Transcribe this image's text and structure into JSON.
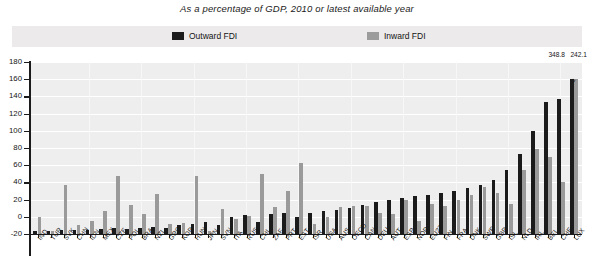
{
  "title": "As a percentage of GDP, 2010 or latest available year",
  "legend": {
    "outward": {
      "label": "Outward FDI",
      "color": "#1b1b1b"
    },
    "inward": {
      "label": "Inward FDI",
      "color": "#9a9a9a"
    }
  },
  "annotations": {
    "lux_outward_value": "348.8",
    "lux_inward_value": "242.1",
    "break_symbol": "≈"
  },
  "chart_data": {
    "type": "bar",
    "title": "As a percentage of GDP, 2010 or latest available year",
    "xlabel": "",
    "ylabel": "",
    "ylim": [
      -20,
      180
    ],
    "yticks": [
      -20,
      0,
      20,
      40,
      60,
      80,
      100,
      120,
      140,
      160,
      180
    ],
    "grid": true,
    "legend_position": "top",
    "categories": [
      "IND",
      "TUR",
      "SVK",
      "CHN",
      "IDN",
      "MEX",
      "CZE",
      "POL",
      "BRA",
      "NZL",
      "GRC",
      "KOR",
      "HUN",
      "JPN",
      "SVN",
      "ITA",
      "RUS",
      "CHL",
      "ZAF",
      "PRT",
      "EST",
      "ISR",
      "USA",
      "AUS",
      "OECD",
      "CAN",
      "DEU",
      "AUT",
      "ESP",
      "NOR",
      "EU27",
      "FIN",
      "FRA",
      "DNK",
      "SWE",
      "GBR",
      "ISL",
      "NLD",
      "IRL",
      "BEL",
      "CHE",
      "LUX"
    ],
    "series": [
      {
        "name": "Outward FDI",
        "color": "#1b1b1b",
        "values": [
          3,
          4,
          5,
          5,
          5,
          6,
          7,
          6,
          7,
          8,
          7,
          10,
          12,
          14,
          11,
          20,
          22,
          14,
          23,
          25,
          20,
          25,
          27,
          28,
          30,
          34,
          37,
          40,
          42,
          44,
          45,
          48,
          50,
          53,
          57,
          63,
          75,
          93,
          120,
          153,
          157,
          348.8
        ]
      },
      {
        "name": "Inward FDI",
        "color": "#9a9a9a",
        "values": [
          20,
          4,
          57,
          10,
          15,
          27,
          67,
          34,
          23,
          46,
          12,
          13,
          68,
          4,
          29,
          18,
          21,
          70,
          31,
          50,
          82,
          12,
          20,
          31,
          32,
          32,
          24,
          23,
          40,
          15,
          35,
          33,
          40,
          45,
          55,
          48,
          35,
          74,
          99,
          89,
          60,
          242.1
        ]
      }
    ],
    "value_labels": {
      "LUX": {
        "outward": "348.8",
        "inward": "242.1"
      }
    },
    "note": "LUX bars are truncated with an axis-break; actual values shown as labels above chart."
  }
}
